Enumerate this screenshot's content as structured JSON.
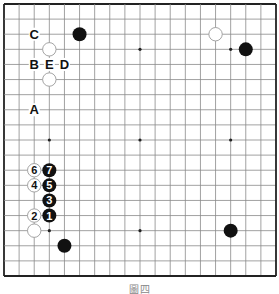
{
  "figure": {
    "caption": "圖四",
    "board_size": 19,
    "origin_px": [
      4,
      4
    ],
    "extent_px": 272,
    "colors": {
      "grid": "#8a8a8a",
      "border": "#222222",
      "black": "#111111",
      "white_fill": "#ffffff",
      "white_stroke": "#9a9a9a",
      "label": "#111111"
    }
  },
  "star_points": [
    [
      3,
      3
    ],
    [
      9,
      3
    ],
    [
      15,
      3
    ],
    [
      3,
      9
    ],
    [
      9,
      9
    ],
    [
      15,
      9
    ],
    [
      3,
      15
    ],
    [
      9,
      15
    ],
    [
      15,
      15
    ]
  ],
  "stones": [
    {
      "color": "black",
      "col": 5,
      "row": 2,
      "label": ""
    },
    {
      "color": "white",
      "col": 3,
      "row": 3,
      "label": ""
    },
    {
      "color": "white",
      "col": 3,
      "row": 5,
      "label": ""
    },
    {
      "color": "white",
      "col": 14,
      "row": 2,
      "label": ""
    },
    {
      "color": "black",
      "col": 16,
      "row": 3,
      "label": ""
    },
    {
      "color": "black",
      "col": 15,
      "row": 15,
      "label": ""
    },
    {
      "color": "black",
      "col": 4,
      "row": 16,
      "label": ""
    },
    {
      "color": "white",
      "col": 2,
      "row": 15,
      "label": ""
    },
    {
      "color": "black",
      "col": 3,
      "row": 14,
      "label": "1"
    },
    {
      "color": "white",
      "col": 2,
      "row": 14,
      "label": "2"
    },
    {
      "color": "black",
      "col": 3,
      "row": 13,
      "label": "3"
    },
    {
      "color": "white",
      "col": 2,
      "row": 12,
      "label": "4"
    },
    {
      "color": "black",
      "col": 3,
      "row": 12,
      "label": "5"
    },
    {
      "color": "white",
      "col": 2,
      "row": 11,
      "label": "6"
    },
    {
      "color": "black",
      "col": 3,
      "row": 11,
      "label": "7"
    }
  ],
  "letters": [
    {
      "text": "C",
      "col": 2,
      "row": 2
    },
    {
      "text": "B",
      "col": 2,
      "row": 4
    },
    {
      "text": "E",
      "col": 3,
      "row": 4
    },
    {
      "text": "D",
      "col": 4,
      "row": 4
    },
    {
      "text": "A",
      "col": 2,
      "row": 7
    }
  ]
}
